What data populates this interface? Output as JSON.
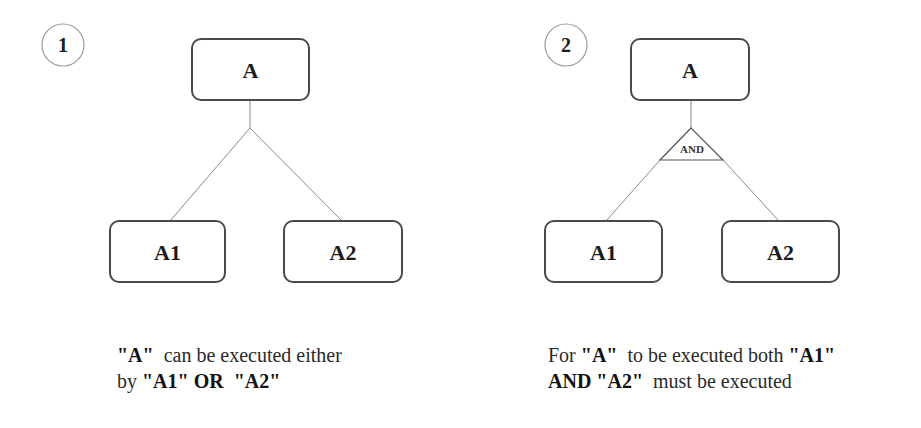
{
  "diagrams": [
    {
      "number": "1",
      "type": "or-decomposition",
      "root": "A",
      "children": [
        "A1",
        "A2"
      ],
      "connector": null,
      "caption": {
        "line1": [
          {
            "text": "\"A\"",
            "bold": true
          },
          {
            "text": "  can be executed either",
            "bold": false
          }
        ],
        "line2": [
          {
            "text": "by ",
            "bold": false
          },
          {
            "text": "\"A1\"",
            "bold": true
          },
          {
            "text": " OR ",
            "bold": true
          },
          {
            "text": " \"A2\"",
            "bold": true
          }
        ]
      }
    },
    {
      "number": "2",
      "type": "and-decomposition",
      "root": "A",
      "children": [
        "A1",
        "A2"
      ],
      "connector": "AND",
      "caption": {
        "line1": [
          {
            "text": "For ",
            "bold": false
          },
          {
            "text": "\"A\"",
            "bold": true
          },
          {
            "text": "  to be executed both ",
            "bold": false
          },
          {
            "text": "\"A1\"",
            "bold": true
          }
        ],
        "line2": [
          {
            "text": "AND ",
            "bold": true
          },
          {
            "text": "\"A2\"",
            "bold": true
          },
          {
            "text": "  must be executed",
            "bold": false
          }
        ]
      }
    }
  ],
  "colors": {
    "box_stroke": "#4a4a4a",
    "line_stroke": "#8a8a8a",
    "circle_stroke": "#9a9a9a",
    "text": "#1c1c1c"
  }
}
